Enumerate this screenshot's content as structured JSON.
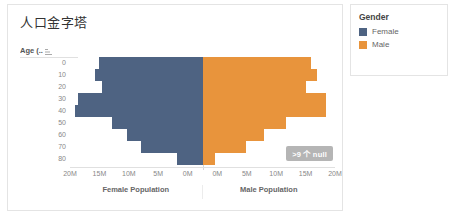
{
  "sheet": {
    "title": "人口金字塔",
    "y_axis_header": "Age (..",
    "sort_icon": "sort-ascending-icon",
    "null_badge": ">9 个 null"
  },
  "legend": {
    "title": "Gender",
    "items": [
      {
        "label": "Female",
        "color": "#4E6382",
        "swatch_icon": "color-swatch-icon"
      },
      {
        "label": "Male",
        "color": "#E8943C",
        "swatch_icon": "color-swatch-icon"
      }
    ]
  },
  "chart_data": {
    "type": "bar",
    "subtype": "population-pyramid",
    "title": "人口金字塔",
    "xlabel": "",
    "ylabel": "Age (..",
    "categories": [
      "0",
      "10",
      "20",
      "30",
      "40",
      "50",
      "60",
      "70",
      "80"
    ],
    "left_axis": {
      "title": "Female Population",
      "ticks": [
        "20M",
        "15M",
        "10M",
        "5M",
        "0M"
      ],
      "range_max": 22.5,
      "units": "M",
      "direction": "reversed"
    },
    "right_axis": {
      "title": "Male Population",
      "ticks": [
        "0M",
        "5M",
        "10M",
        "15M",
        "20M"
      ],
      "range_max": 22.5,
      "units": "M",
      "direction": "normal"
    },
    "grid": false,
    "legend_position": "right",
    "series": [
      {
        "name": "Female",
        "color": "#4E6382",
        "side": "left",
        "values": [
          17.5,
          18.2,
          17.0,
          21.2,
          21.6,
          15.3,
          12.9,
          10.4,
          4.4
        ]
      },
      {
        "name": "Male",
        "color": "#E8943C",
        "side": "right",
        "values": [
          18.4,
          19.5,
          17.6,
          21.0,
          20.9,
          14.1,
          10.4,
          7.4,
          2.2
        ]
      }
    ]
  },
  "xaxis_ticks": [
    {
      "label": "20M",
      "pos": 0.0
    },
    {
      "label": "15M",
      "pos": 0.111
    },
    {
      "label": "10M",
      "pos": 0.222
    },
    {
      "label": "5M",
      "pos": 0.333
    },
    {
      "label": "0M",
      "pos": 0.444
    },
    {
      "label": "0M",
      "pos": 0.556
    },
    {
      "label": "5M",
      "pos": 0.667
    },
    {
      "label": "10M",
      "pos": 0.778
    },
    {
      "label": "15M",
      "pos": 0.889
    },
    {
      "label": "20M",
      "pos": 1.0
    }
  ]
}
